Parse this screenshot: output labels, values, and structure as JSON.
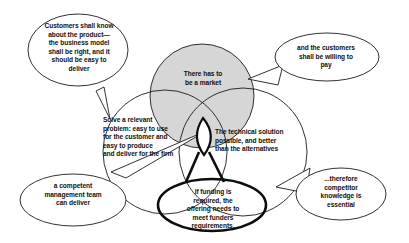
{
  "diagram": {
    "type": "venn-three-circle-with-callouts",
    "background_color": "#ffffff",
    "stroke_color": "#1b1b1b",
    "shaded_fill_color": "#d6d6d6",
    "bold_stroke_color": "#0d0d0d",
    "circles": [
      {
        "id": "market",
        "name": "market-circle",
        "label": "There has to\nbe a market",
        "filled": true,
        "fill_color": "#d6d6d6",
        "emphasis": "shaded"
      },
      {
        "id": "problem",
        "name": "problem-circle",
        "label": "Solve a relevant\nproblem: easy to use\nfor the customer and\neasy to  produce\nand  deliver for  the  firm",
        "filled": false,
        "fill_color": "none",
        "emphasis": "normal"
      },
      {
        "id": "technical",
        "name": "technical-circle",
        "label": "The technical solution\npossible, and better\nthan the alternatives",
        "filled": false,
        "fill_color": "none",
        "emphasis": "normal"
      }
    ],
    "highlight_ellipse": {
      "id": "funding",
      "name": "funding-ellipse",
      "label": "If funding is\nrequired, the\noffering needs to\nmeet funders\nrequirements.",
      "emphasis": "bold-outline"
    },
    "center_lens": {
      "id": "sweet-spot",
      "name": "intersection-lens",
      "label": "",
      "emphasis": "bold-outline"
    },
    "callouts": [
      {
        "id": "customers-know",
        "name": "callout-customers-know",
        "label": "Customers shall know\nabout the product—\nthe business model\nshall be right, and it\nshould be easy to\ndeliver",
        "points_to": "problem-circle",
        "tail_direction": "down"
      },
      {
        "id": "willing-to-pay",
        "name": "callout-willing-to-pay",
        "label": "and the customers\nshall be willing to\npay",
        "points_to": "market-circle",
        "tail_direction": "left"
      },
      {
        "id": "management-team",
        "name": "callout-management-team",
        "label": "a competent\nmanagement team\ncan deliver",
        "points_to": "intersection-lens",
        "tail_direction": "up-right"
      },
      {
        "id": "competitor-knowledge",
        "name": "callout-competitor-knowledge",
        "label": "...therefore\ncompetitor\nknowledge is\nessential",
        "points_to": "technical-circle",
        "tail_direction": "left"
      }
    ]
  }
}
